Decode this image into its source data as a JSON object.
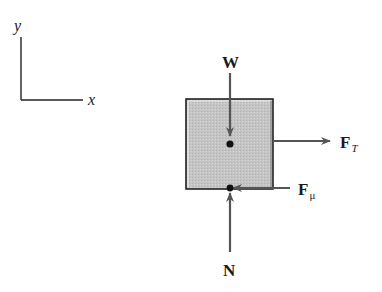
{
  "diagram": {
    "axes": {
      "y_label": "y",
      "x_label": "x"
    },
    "forces": {
      "weight": {
        "symbol": "W",
        "direction": "down"
      },
      "tension": {
        "symbol": "F",
        "subscript": "T",
        "direction": "right"
      },
      "friction": {
        "symbol": "F",
        "subscript": "μ",
        "direction": "left"
      },
      "normal": {
        "symbol": "N",
        "direction": "up"
      }
    },
    "colors": {
      "block_fill": "#c8c8c8",
      "block_border": "#222222",
      "arrow": "#555555",
      "point": "#111111"
    }
  }
}
